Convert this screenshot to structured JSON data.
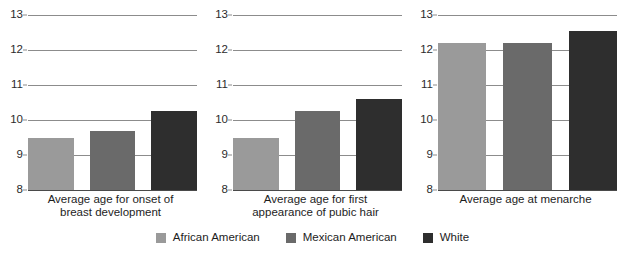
{
  "chart_data": {
    "type": "bar",
    "title": "",
    "subtitle": "",
    "xlabel": "",
    "ylabel": "",
    "ylim": [
      8,
      13
    ],
    "yticks": [
      8,
      9,
      10,
      11,
      12,
      13
    ],
    "ytick_labels": [
      "8",
      "9",
      "10",
      "11",
      "12",
      "13"
    ],
    "grid": true,
    "legend_position": "bottom",
    "categories": [
      "Average age for onset of breast development",
      "Average age for first appearance of pubic hair",
      "Average age at menarche"
    ],
    "series": [
      {
        "name": "African American",
        "color": "#9a9a9a",
        "values": [
          9.5,
          9.5,
          12.2
        ]
      },
      {
        "name": "Mexican American",
        "color": "#6a6a6a",
        "values": [
          9.7,
          10.25,
          12.2
        ]
      },
      {
        "name": "White",
        "color": "#2e2e2e",
        "values": [
          10.25,
          10.6,
          12.55
        ]
      }
    ]
  },
  "panels": [
    {
      "caption_lines": [
        "Average age for onset of",
        "breast development"
      ],
      "yticks": [
        "13",
        "12",
        "11",
        "10",
        "9",
        "8"
      ],
      "bars": [
        {
          "series": "African American",
          "value": 9.5,
          "color": "#9a9a9a"
        },
        {
          "series": "Mexican American",
          "value": 9.7,
          "color": "#6a6a6a"
        },
        {
          "series": "White",
          "value": 10.25,
          "color": "#2e2e2e"
        }
      ]
    },
    {
      "caption_lines": [
        "Average age for first",
        "appearance of pubic hair"
      ],
      "yticks": [
        "13",
        "12",
        "11",
        "10",
        "9",
        "8"
      ],
      "bars": [
        {
          "series": "African American",
          "value": 9.5,
          "color": "#9a9a9a"
        },
        {
          "series": "Mexican American",
          "value": 10.25,
          "color": "#6a6a6a"
        },
        {
          "series": "White",
          "value": 10.6,
          "color": "#2e2e2e"
        }
      ]
    },
    {
      "caption_lines": [
        "Average age at menarche"
      ],
      "yticks": [
        "13",
        "12",
        "11",
        "10",
        "9",
        "8"
      ],
      "bars": [
        {
          "series": "African American",
          "value": 12.2,
          "color": "#9a9a9a"
        },
        {
          "series": "Mexican American",
          "value": 12.2,
          "color": "#6a6a6a"
        },
        {
          "series": "White",
          "value": 12.55,
          "color": "#2e2e2e"
        }
      ]
    }
  ],
  "legend": {
    "items": [
      {
        "label": "African American",
        "color": "#9a9a9a"
      },
      {
        "label": "Mexican American",
        "color": "#6a6a6a"
      },
      {
        "label": "White",
        "color": "#2e2e2e"
      }
    ]
  },
  "axis": {
    "y_min": 8,
    "y_max": 13,
    "gridline_color": "#8c8c8c",
    "baseline_color": "#4a4a4a"
  }
}
